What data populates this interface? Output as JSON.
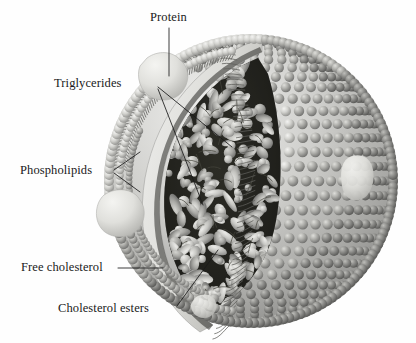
{
  "figure": {
    "background_color": "#fefefe",
    "ink_color": "#1a1a1a",
    "palette": {
      "shell_light": "#e4e4e2",
      "shell_mid": "#b9b9b6",
      "head_light": "#d8d8d5",
      "head_dark": "#6f6f6d",
      "head_mid": "#9a9a97",
      "core_dark": "#141414",
      "core_lipid_light": "#d6d6d2",
      "core_lipid_mid": "#a3a3a0",
      "protein_fill": "#dcdcd8",
      "tail_stroke": "#5c5c5a"
    },
    "geometry": {
      "center_x": 251,
      "center_y": 181,
      "radius": 147,
      "membrane_thickness": 26
    }
  },
  "labels": {
    "protein": {
      "text": "Protein",
      "leader": "vertical line down into membrane-embedded protein blob"
    },
    "triglycerides": {
      "text": "Triglycerides",
      "leader": "two diagonal lines into the lipid core"
    },
    "phospholipids": {
      "text": "Phospholipids",
      "leader": "two short lines to outer surface head groups"
    },
    "free_cholesterol": {
      "text": "Free cholesterol",
      "leader": "horizontal line to surface monolayer"
    },
    "cholesterol_esters": {
      "text": "Cholesterol esters",
      "leader": "diagonal line up into lower lipid core"
    }
  },
  "structures": {
    "outer_monolayer": "phospholipid head groups rendered as rows of spheres over the sphere surface",
    "cut_face": "wedge-shaped cut-away revealing interior core",
    "core": "densely packed triglyceride and cholesterol ester droplets",
    "embedded_proteins": [
      {
        "name": "apolipoprotein-top-left",
        "cx": 160,
        "cy": 78
      },
      {
        "name": "apolipoprotein-mid-left",
        "cx": 119,
        "cy": 213
      },
      {
        "name": "apolipoprotein-right",
        "cx": 356,
        "cy": 178
      }
    ]
  }
}
